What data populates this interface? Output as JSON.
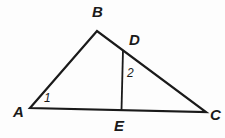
{
  "diagram": {
    "type": "geometry-triangle-figure",
    "vertex_labels": {
      "A": "A",
      "B": "B",
      "C": "C",
      "D": "D",
      "E": "E"
    },
    "angle_labels": {
      "angle1": "1",
      "angle2": "2"
    },
    "colors": {
      "line": "#1a1a1a",
      "background": "#fdfdfd"
    }
  }
}
